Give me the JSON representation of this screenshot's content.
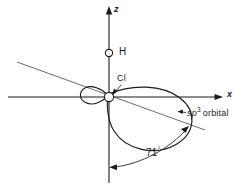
{
  "figure": {
    "kind": "orbital-geometry-diagram",
    "width": 248,
    "height": 188,
    "background_color": "#ffffff",
    "line_color": "#1b1b1b"
  },
  "axes": {
    "z": {
      "label": "z",
      "orientation": "vertical",
      "arrow_at": "top",
      "x_px": 109,
      "from_y_px": 8,
      "to_y_px": 183
    },
    "x": {
      "label": "x",
      "orientation": "horizontal",
      "arrow_at": "right",
      "y_px": 97,
      "from_x_px": 8,
      "to_x_px": 222
    }
  },
  "atoms": [
    {
      "symbol": "H",
      "label": "H",
      "marker": "open-circle",
      "cx_px": 109,
      "cy_px": 53,
      "r_px": 3.6,
      "on_axis": "z"
    },
    {
      "symbol": "Cl",
      "label": "Cl",
      "marker": "open-circle",
      "cx_px": 109,
      "cy_px": 97,
      "r_px": 4.6,
      "on_axis": "origin"
    }
  ],
  "orbital": {
    "label_sp": "sp",
    "label_superscript": "3",
    "label_word": "orbital",
    "label_full": "sp3 orbital",
    "shape": "teardrop-with-back-lobe",
    "axis_tilt_deg": 20,
    "axis_from_px": [
      17,
      62
    ],
    "axis_to_px": [
      205,
      130
    ],
    "major_lobe_direction": "down-right",
    "minor_lobe_direction": "up-left"
  },
  "angle": {
    "value": "71",
    "degree_symbol": "°",
    "label": "71°",
    "measured_between": [
      "negative z-axis",
      "sp3 orbital axis"
    ],
    "arc_start_px": [
      109,
      167
    ],
    "arc_end_px": [
      196,
      124
    ]
  },
  "colors": {
    "ink": "#1b1b1b",
    "thin_ink": "#3a3a3a",
    "paper": "#ffffff"
  }
}
